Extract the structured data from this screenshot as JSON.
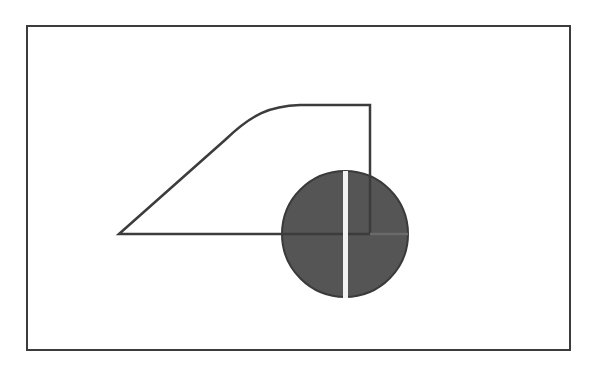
{
  "diagram": {
    "colors": {
      "background": "#ffffff",
      "stroke": "#3c3c3c",
      "circle_fill": "#555555",
      "circle_stroke": "#3a3a3a",
      "bar": "#f2f2f2",
      "axis_line_right": "#6a6a6a"
    },
    "frame": {
      "x": 27,
      "y": 26,
      "width": 543,
      "height": 324
    },
    "shape": {
      "path": "M119,234 L225,140 C252,114 270,106 300,105 L370,105 L370,234 Z"
    },
    "marker": {
      "cx": 345,
      "cy": 234,
      "r": 63,
      "bar": {
        "x": 343,
        "y": 171,
        "width": 5,
        "height": 127
      }
    }
  }
}
